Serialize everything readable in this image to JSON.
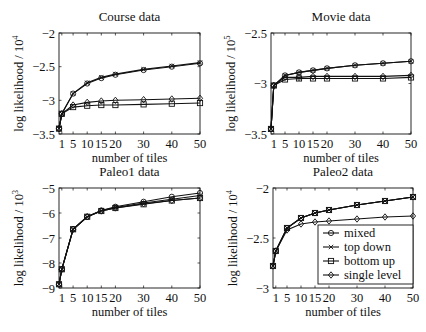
{
  "figure": {
    "x_ticks": [
      1,
      5,
      10,
      15,
      20,
      30,
      40,
      50
    ],
    "xlabel": "number of tiles",
    "legend": [
      "mixed",
      "top down",
      "bottom up",
      "single level"
    ]
  },
  "chart_data": [
    {
      "type": "line",
      "title": "Course data",
      "xlabel": "number of tiles",
      "ylabel": "log likelihood / 10",
      "ylabel_exp": "4",
      "x": [
        0,
        1,
        5,
        10,
        15,
        20,
        30,
        40,
        50
      ],
      "xlim": [
        0,
        50
      ],
      "ylim": [
        -3.5,
        -2
      ],
      "y_ticks": [
        -3.5,
        -3,
        -2.5,
        -2
      ],
      "y_tick_labels": [
        "-3.5",
        "-3",
        "-2.5",
        "-2"
      ],
      "grid": false,
      "series": [
        {
          "name": "mixed",
          "values": [
            -3.42,
            -3.2,
            -2.9,
            -2.75,
            -2.67,
            -2.62,
            -2.55,
            -2.5,
            -2.45
          ]
        },
        {
          "name": "top down",
          "values": [
            -3.42,
            -3.2,
            -2.9,
            -2.74,
            -2.66,
            -2.61,
            -2.54,
            -2.49,
            -2.44
          ]
        },
        {
          "name": "bottom up",
          "values": [
            -3.42,
            -3.2,
            -3.1,
            -3.08,
            -3.07,
            -3.07,
            -3.06,
            -3.05,
            -3.04
          ]
        },
        {
          "name": "single level",
          "values": [
            -3.42,
            -3.2,
            -3.07,
            -3.03,
            -3.01,
            -3.0,
            -2.99,
            -2.98,
            -2.97
          ]
        }
      ]
    },
    {
      "type": "line",
      "title": "Movie data",
      "xlabel": "number of tiles",
      "ylabel": "log likelihood / 10",
      "ylabel_exp": "5",
      "x": [
        0,
        1,
        5,
        10,
        15,
        20,
        30,
        40,
        50
      ],
      "xlim": [
        0,
        50
      ],
      "ylim": [
        -3.5,
        -2.5
      ],
      "y_ticks": [
        -3.5,
        -3,
        -2.5
      ],
      "y_tick_labels": [
        "-3.5",
        "-3",
        "-2.5"
      ],
      "grid": false,
      "series": [
        {
          "name": "mixed",
          "values": [
            -3.45,
            -3.02,
            -2.92,
            -2.89,
            -2.87,
            -2.85,
            -2.82,
            -2.8,
            -2.78
          ]
        },
        {
          "name": "top down",
          "values": [
            -3.45,
            -3.02,
            -2.92,
            -2.89,
            -2.87,
            -2.85,
            -2.82,
            -2.8,
            -2.78
          ]
        },
        {
          "name": "bottom up",
          "values": [
            -3.45,
            -3.02,
            -2.96,
            -2.95,
            -2.95,
            -2.95,
            -2.95,
            -2.95,
            -2.94
          ]
        },
        {
          "name": "single level",
          "values": [
            -3.45,
            -3.02,
            -2.94,
            -2.94,
            -2.93,
            -2.93,
            -2.93,
            -2.93,
            -2.92
          ]
        }
      ]
    },
    {
      "type": "line",
      "title": "Paleo1 data",
      "xlabel": "number of tiles",
      "ylabel": "log likelihood / 10",
      "ylabel_exp": "3",
      "x": [
        0,
        1,
        5,
        10,
        15,
        20,
        30,
        40,
        50
      ],
      "xlim": [
        0,
        50
      ],
      "ylim": [
        -9,
        -5
      ],
      "y_ticks": [
        -9,
        -8,
        -7,
        -6,
        -5
      ],
      "y_tick_labels": [
        "-9",
        "-8",
        "-7",
        "-6",
        "-5"
      ],
      "grid": false,
      "series": [
        {
          "name": "mixed",
          "values": [
            -8.85,
            -8.25,
            -6.65,
            -6.15,
            -5.9,
            -5.75,
            -5.55,
            -5.35,
            -5.2
          ]
        },
        {
          "name": "top down",
          "values": [
            -8.85,
            -8.25,
            -6.65,
            -6.15,
            -5.9,
            -5.78,
            -5.6,
            -5.45,
            -5.3
          ]
        },
        {
          "name": "bottom up",
          "values": [
            -8.85,
            -8.25,
            -6.65,
            -6.15,
            -5.92,
            -5.8,
            -5.65,
            -5.5,
            -5.4
          ]
        },
        {
          "name": "single level",
          "values": [
            -8.85,
            -8.25,
            -6.65,
            -6.15,
            -5.92,
            -5.8,
            -5.63,
            -5.5,
            -5.4
          ]
        }
      ]
    },
    {
      "type": "line",
      "title": "Paleo2 data",
      "xlabel": "number of tiles",
      "ylabel": "log likelihood / 10",
      "ylabel_exp": "4",
      "x": [
        0,
        1,
        5,
        10,
        15,
        20,
        30,
        40,
        50
      ],
      "xlim": [
        0,
        50
      ],
      "ylim": [
        -3,
        -2
      ],
      "y_ticks": [
        -3,
        -2.5,
        -2
      ],
      "y_tick_labels": [
        "-3",
        "-2.5",
        "-2"
      ],
      "grid": false,
      "legend_position": "lower right",
      "series": [
        {
          "name": "mixed",
          "values": [
            -2.78,
            -2.63,
            -2.4,
            -2.3,
            -2.25,
            -2.22,
            -2.17,
            -2.13,
            -2.09
          ]
        },
        {
          "name": "top down",
          "values": [
            -2.78,
            -2.63,
            -2.4,
            -2.3,
            -2.25,
            -2.22,
            -2.17,
            -2.13,
            -2.09
          ]
        },
        {
          "name": "bottom up",
          "values": [
            -2.78,
            -2.63,
            -2.4,
            -2.3,
            -2.25,
            -2.22,
            -2.17,
            -2.13,
            -2.09
          ]
        },
        {
          "name": "single level",
          "values": [
            -2.78,
            -2.63,
            -2.42,
            -2.36,
            -2.34,
            -2.33,
            -2.31,
            -2.29,
            -2.28
          ]
        }
      ]
    }
  ]
}
